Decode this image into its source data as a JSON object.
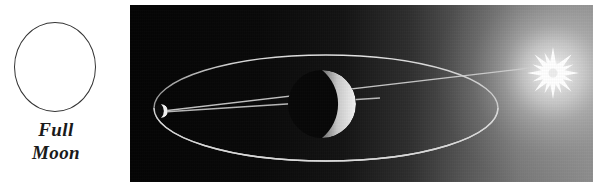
{
  "figure": {
    "background_color": "#ffffff",
    "width": 600,
    "height": 191
  },
  "phase_key": {
    "circle": {
      "name": "full-moon-disc",
      "fill_color": "#ffffff",
      "stroke_color": "#333333"
    },
    "caption_line_1": "Full",
    "caption_line_2": "Moon"
  },
  "orbit_panel": {
    "background_dark": "#050505",
    "background_light": "#8d8d8d",
    "sun": {
      "label": "sun",
      "color": "#ffffff",
      "glow_color": "#f2f2f2",
      "points": 16
    },
    "earth": {
      "label": "earth",
      "shadow_color": "#080808",
      "lit_limb_color": "#e8e8e8"
    },
    "moon": {
      "label": "moon",
      "lit_limb_color": "#f5f5f5"
    },
    "orbit": {
      "label": "moon-orbit-ellipse",
      "stroke_color": "#d6d6d6"
    },
    "sight_lines": {
      "label": "sun-moon-alignment-lines",
      "stroke_color": "#cfcfcf",
      "count": 2
    }
  }
}
